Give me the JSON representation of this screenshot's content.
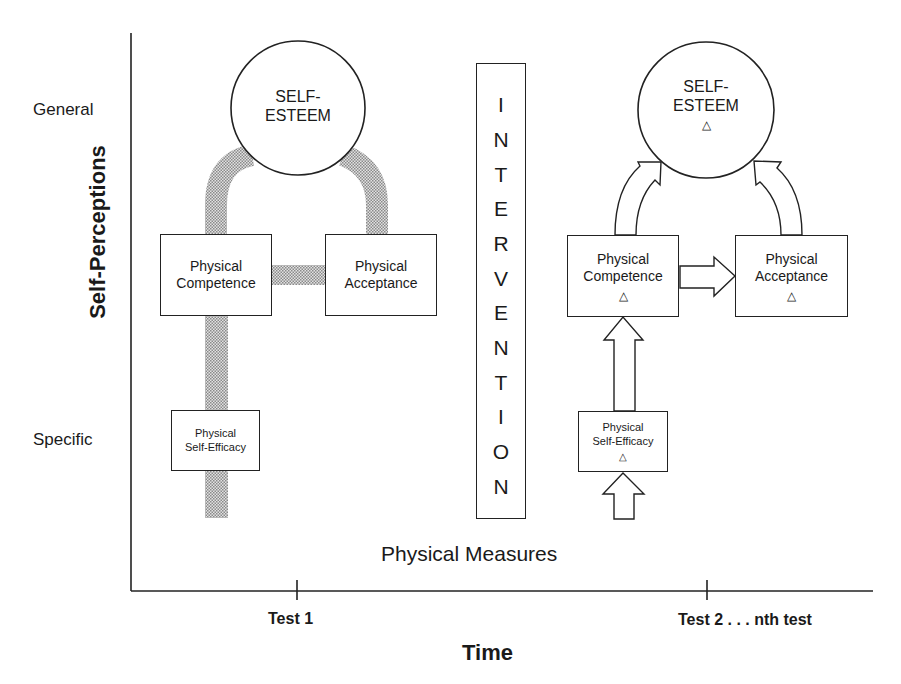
{
  "y_axis": {
    "title": "Self-Perceptions",
    "levels": {
      "top": "General",
      "bottom": "Specific"
    }
  },
  "x_axis": {
    "title": "Time",
    "ticks": [
      "Test 1",
      "Test 2 . . . nth test"
    ]
  },
  "baseline_label": "Physical Measures",
  "intervention": {
    "letters": [
      "I",
      "N",
      "T",
      "E",
      "R",
      "V",
      "E",
      "N",
      "T",
      "I",
      "O",
      "N"
    ],
    "word": "INTERVENTION"
  },
  "test1_model": {
    "self_esteem": {
      "line1": "SELF-",
      "line2": "ESTEEM"
    },
    "physical_competence": {
      "line1": "Physical",
      "line2": "Competence"
    },
    "physical_acceptance": {
      "line1": "Physical",
      "line2": "Acceptance"
    },
    "physical_self_efficacy": {
      "line1": "Physical",
      "line2": "Self-Efficacy"
    },
    "connections": "shaded (stippled) links: Self-Efficacy – Competence – Self-Esteem – Acceptance; Competence – Acceptance"
  },
  "test2_model": {
    "change_symbol": "△",
    "self_esteem": {
      "line1": "SELF-",
      "line2": "ESTEEM"
    },
    "physical_competence": {
      "line1": "Physical",
      "line2": "Competence"
    },
    "physical_acceptance": {
      "line1": "Physical",
      "line2": "Acceptance"
    },
    "physical_self_efficacy": {
      "line1": "Physical",
      "line2": "Self-Efficacy"
    },
    "connections": "open arrows: input → Self-Efficacy → Competence → Self-Esteem; Competence → Acceptance → Self-Esteem"
  },
  "colors": {
    "line": "#222222",
    "stipple": "#b5b5b5",
    "background": "#ffffff"
  }
}
